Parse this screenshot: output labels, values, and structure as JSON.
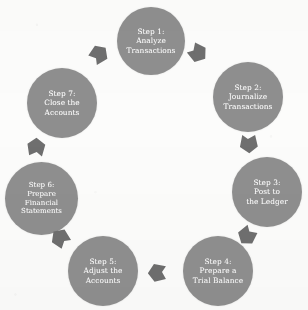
{
  "diagram": {
    "type": "cycle",
    "direction": "clockwise",
    "node_shape": "circle",
    "node_color": "#8f8f8f",
    "node_text_color": "#ffffff",
    "arrow_color": "#6f6f6f",
    "background_color": "#fdfdfc",
    "steps": [
      {
        "id": "step-1",
        "number": "1",
        "heading": "Step 1:",
        "body": "Analyze\nTransactions",
        "label": "Step 1:\nAnalyze\nTransactions",
        "position": "top"
      },
      {
        "id": "step-2",
        "number": "2",
        "heading": "Step 2:",
        "body": "Journalize\nTransactions",
        "label": "Step 2:\nJournalize\nTransactions",
        "position": "upper-right"
      },
      {
        "id": "step-3",
        "number": "3",
        "heading": "Step 3:",
        "body": "Post to\nthe Ledger",
        "label": "Step 3:\nPost to\nthe Ledger",
        "position": "right"
      },
      {
        "id": "step-4",
        "number": "4",
        "heading": "Step 4:",
        "body": "Prepare a\nTrial Balance",
        "label": "Step 4:\nPrepare a\nTrial Balance",
        "position": "lower-right"
      },
      {
        "id": "step-5",
        "number": "5",
        "heading": "Step 5:",
        "body": "Adjust the\nAccounts",
        "label": "Step 5:\nAdjust the\nAccounts",
        "position": "lower-left"
      },
      {
        "id": "step-6",
        "number": "6",
        "heading": "Step 6:",
        "body": "Prepare\nFinancial\nStatements",
        "label": "Step 6:\nPrepare\nFinancial\nStatements",
        "position": "left"
      },
      {
        "id": "step-7",
        "number": "7",
        "heading": "Step 7:",
        "body": "Close the\nAccounts",
        "label": "Step 7:\nClose the\nAccounts",
        "position": "upper-left"
      }
    ],
    "connectors": [
      {
        "id": "arrow-1-to-2",
        "from": "step-1",
        "to": "step-2",
        "shape": "arrow"
      },
      {
        "id": "arrow-2-to-3",
        "from": "step-2",
        "to": "step-3",
        "shape": "arrow"
      },
      {
        "id": "arrow-3-to-4",
        "from": "step-3",
        "to": "step-4",
        "shape": "arrow"
      },
      {
        "id": "arrow-4-to-5",
        "from": "step-4",
        "to": "step-5",
        "shape": "arrow"
      },
      {
        "id": "arrow-5-to-6",
        "from": "step-5",
        "to": "step-6",
        "shape": "arrow"
      },
      {
        "id": "arrow-6-to-7",
        "from": "step-6",
        "to": "step-7",
        "shape": "arrow"
      },
      {
        "id": "arrow-7-to-1",
        "from": "step-7",
        "to": "step-1",
        "shape": "arrow"
      }
    ]
  }
}
